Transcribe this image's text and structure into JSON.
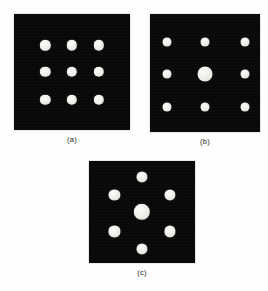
{
  "figure": {
    "background_color": "#fefefe",
    "plate_color": "#080808",
    "dot_color": "#e9e9e4",
    "caption_color": "#1c1c1c"
  },
  "panels": [
    {
      "id": "panel-a",
      "caption": "(a)",
      "arrangement": "3x3 square lattice, uniform dot size",
      "rect": {
        "x": 14,
        "y": 14,
        "w": 116,
        "h": 116
      },
      "caption_pos": {
        "x": 14,
        "y": 135,
        "w": 116
      },
      "dots": [
        {
          "name": "dot-row1-col1",
          "cx": 27,
          "cy": 27,
          "d": 9.0
        },
        {
          "name": "dot-row1-col2",
          "cx": 50,
          "cy": 27,
          "d": 9.0
        },
        {
          "name": "dot-row1-col3",
          "cx": 73,
          "cy": 27,
          "d": 9.0
        },
        {
          "name": "dot-row2-col1",
          "cx": 27,
          "cy": 50,
          "d": 9.0
        },
        {
          "name": "dot-row2-col2",
          "cx": 50,
          "cy": 50,
          "d": 9.0
        },
        {
          "name": "dot-row2-col3",
          "cx": 73,
          "cy": 50,
          "d": 9.0
        },
        {
          "name": "dot-row3-col1",
          "cx": 27,
          "cy": 74,
          "d": 9.0
        },
        {
          "name": "dot-row3-col2",
          "cx": 50,
          "cy": 74,
          "d": 9.0
        },
        {
          "name": "dot-row3-col3",
          "cx": 73,
          "cy": 74,
          "d": 9.0
        }
      ]
    },
    {
      "id": "panel-b",
      "caption": "(b)",
      "arrangement": "3x3 square lattice, enlarged centre dot, wider spacing",
      "rect": {
        "x": 150,
        "y": 14,
        "w": 110,
        "h": 118
      },
      "caption_pos": {
        "x": 150,
        "y": 137,
        "w": 110
      },
      "dots": [
        {
          "name": "dot-row1-col1",
          "cx": 15,
          "cy": 24,
          "d": 8.2
        },
        {
          "name": "dot-row1-col2",
          "cx": 50,
          "cy": 24,
          "d": 8.2
        },
        {
          "name": "dot-row1-col3",
          "cx": 86,
          "cy": 24,
          "d": 8.2
        },
        {
          "name": "dot-row2-col1",
          "cx": 15,
          "cy": 51,
          "d": 8.2
        },
        {
          "name": "dot-centre",
          "cx": 50,
          "cy": 51,
          "d": 13.6
        },
        {
          "name": "dot-row2-col3",
          "cx": 86,
          "cy": 51,
          "d": 8.2
        },
        {
          "name": "dot-row3-col1",
          "cx": 15,
          "cy": 79,
          "d": 8.2
        },
        {
          "name": "dot-row3-col2",
          "cx": 50,
          "cy": 79,
          "d": 8.2
        },
        {
          "name": "dot-row3-col3",
          "cx": 86,
          "cy": 79,
          "d": 8.2
        }
      ]
    },
    {
      "id": "panel-c",
      "caption": "(c)",
      "arrangement": "hexagonal ring of six dots around an enlarged centre dot",
      "rect": {
        "x": 89,
        "y": 161,
        "w": 106,
        "h": 102
      },
      "caption_pos": {
        "x": 89,
        "y": 268,
        "w": 106
      },
      "dots": [
        {
          "name": "dot-ring-top",
          "cx": 50,
          "cy": 16,
          "d": 10.5
        },
        {
          "name": "dot-ring-upper-left",
          "cx": 24,
          "cy": 33,
          "d": 10.5
        },
        {
          "name": "dot-ring-upper-right",
          "cx": 76,
          "cy": 33,
          "d": 10.5
        },
        {
          "name": "dot-centre",
          "cx": 50,
          "cy": 50,
          "d": 15.5
        },
        {
          "name": "dot-ring-lower-left",
          "cx": 24,
          "cy": 69,
          "d": 10.5
        },
        {
          "name": "dot-ring-lower-right",
          "cx": 76,
          "cy": 69,
          "d": 10.5
        },
        {
          "name": "dot-ring-bottom",
          "cx": 50,
          "cy": 86,
          "d": 10.5
        }
      ]
    }
  ]
}
